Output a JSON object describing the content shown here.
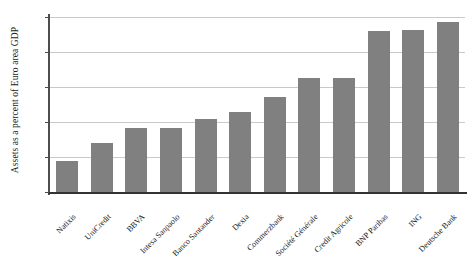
{
  "chart_data": {
    "type": "bar",
    "title": "",
    "xlabel": "",
    "ylabel": "Assets as a percent of Euro area GDP",
    "ylim": [
      0,
      10
    ],
    "yticks": [
      0,
      2,
      4,
      6,
      8,
      10
    ],
    "ytick_labels": [
      "0",
      "2",
      "4",
      "6",
      "8",
      "10"
    ],
    "grid": true,
    "legend": null,
    "bar_color": "#808080",
    "categories": [
      "Natixis",
      "UniCredit",
      "BBVA",
      "Intesa Sanpaolo",
      "Banco Santander",
      "Dexia",
      "Commerzbank",
      "Société Générale",
      "Credit Agricole",
      "BNP Paribas",
      "ING",
      "Deutsche Bank"
    ],
    "values": [
      1.75,
      2.8,
      3.65,
      3.65,
      4.2,
      4.55,
      5.45,
      6.5,
      6.5,
      9.2,
      9.25,
      9.7
    ]
  }
}
